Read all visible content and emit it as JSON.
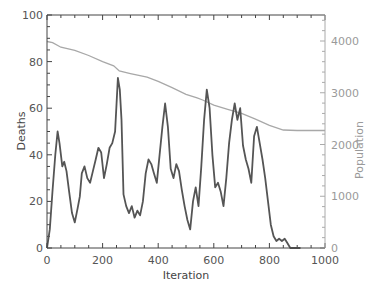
{
  "chart_data": {
    "type": "line",
    "title": "",
    "xlabel": "Iteration",
    "ylabel": "Deaths",
    "y2label": "Population",
    "xlim": [
      0,
      1000
    ],
    "ylim": [
      0,
      100
    ],
    "y2lim": [
      0,
      4500
    ],
    "x_ticks": [
      0,
      200,
      400,
      600,
      800,
      1000
    ],
    "y_ticks": [
      0,
      20,
      40,
      60,
      80,
      100
    ],
    "y2_ticks": [
      0,
      1000,
      2000,
      3000,
      4000
    ],
    "grid": false,
    "legend": null,
    "series": [
      {
        "name": "Deaths",
        "axis": "left",
        "color": "#555555",
        "x": [
          0,
          10,
          20,
          30,
          38,
          45,
          55,
          62,
          70,
          80,
          90,
          100,
          110,
          118,
          125,
          135,
          145,
          155,
          165,
          175,
          185,
          195,
          205,
          215,
          225,
          235,
          245,
          255,
          262,
          268,
          275,
          285,
          295,
          305,
          315,
          325,
          335,
          345,
          355,
          365,
          375,
          385,
          395,
          405,
          415,
          425,
          435,
          445,
          455,
          465,
          475,
          485,
          495,
          505,
          515,
          525,
          535,
          545,
          555,
          565,
          575,
          585,
          595,
          605,
          615,
          625,
          635,
          645,
          655,
          665,
          675,
          685,
          695,
          705,
          715,
          725,
          735,
          745,
          755,
          765,
          775,
          785,
          795,
          805,
          815,
          825,
          835,
          845,
          855,
          865,
          875,
          885,
          895,
          905,
          912
        ],
        "values": [
          0,
          8,
          25,
          40,
          50,
          45,
          35,
          37,
          33,
          24,
          15,
          11,
          17,
          22,
          32,
          35,
          30,
          28,
          33,
          38,
          43,
          41,
          30,
          36,
          43,
          45,
          50,
          73,
          68,
          55,
          23,
          18,
          15,
          18,
          13,
          16,
          14,
          20,
          32,
          38,
          36,
          32,
          28,
          40,
          52,
          62,
          52,
          34,
          30,
          36,
          33,
          25,
          18,
          12,
          8,
          20,
          26,
          18,
          35,
          55,
          68,
          60,
          40,
          26,
          28,
          24,
          18,
          30,
          45,
          55,
          62,
          55,
          60,
          44,
          38,
          34,
          28,
          48,
          52,
          45,
          38,
          30,
          20,
          10,
          5,
          3,
          4,
          3,
          4,
          2,
          0,
          0,
          0,
          0,
          0
        ]
      },
      {
        "name": "Population",
        "axis": "right",
        "color": "#a8a8a8",
        "x": [
          0,
          20,
          50,
          100,
          150,
          200,
          240,
          260,
          300,
          360,
          400,
          450,
          500,
          540,
          560,
          600,
          650,
          700,
          750,
          800,
          850,
          900,
          950,
          1000
        ],
        "values": [
          3990,
          3970,
          3880,
          3820,
          3720,
          3600,
          3520,
          3420,
          3370,
          3300,
          3220,
          3100,
          2970,
          2900,
          2860,
          2760,
          2680,
          2600,
          2490,
          2370,
          2280,
          2270,
          2270,
          2270
        ]
      }
    ]
  },
  "axes": {
    "xlabel": "Iteration",
    "ylabel": "Deaths",
    "y2label": "Population",
    "x_tick_labels": [
      "0",
      "200",
      "400",
      "600",
      "800",
      "1000"
    ],
    "y_tick_labels": [
      "0",
      "20",
      "40",
      "60",
      "80",
      "100"
    ],
    "y2_tick_labels": [
      "0",
      "1000",
      "2000",
      "3000",
      "4000"
    ]
  }
}
